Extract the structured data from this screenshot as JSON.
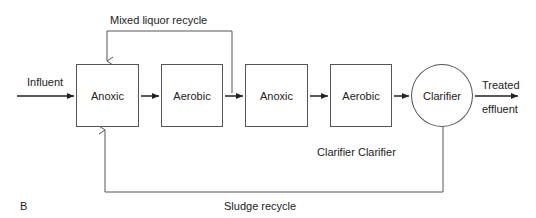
{
  "diagram": {
    "panel_label": "B",
    "influent": "Influent",
    "units": [
      {
        "label": "Anoxic"
      },
      {
        "label": "Aerobic"
      },
      {
        "label": "Anoxic"
      },
      {
        "label": "Aerobic"
      }
    ],
    "clarifier": "Clarifier",
    "effluent_line1": "Treated",
    "effluent_line2": "effluent",
    "mixed_liquor_recycle": "Mixed liquor recycle",
    "sludge_recycle": "Sludge recycle",
    "extra_caption": "Clarifier Clarifier",
    "line_color": "#555555"
  }
}
